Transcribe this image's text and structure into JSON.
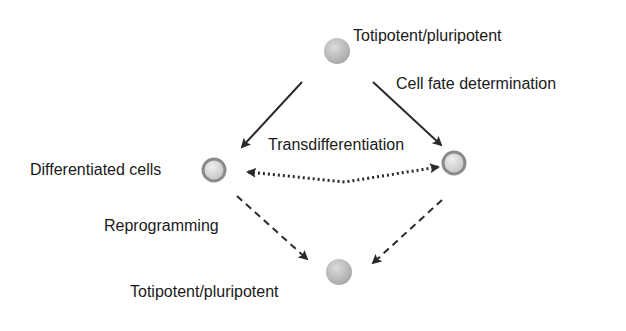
{
  "diagram": {
    "nodes": {
      "top": {
        "label": "Totipotent/pluripotent",
        "type": "totipotent"
      },
      "left": {
        "label": "Differentiated cells",
        "type": "differentiated"
      },
      "right": {
        "label": "",
        "type": "differentiated"
      },
      "bottom": {
        "label": "Totipotent/pluripotent",
        "type": "totipotent"
      }
    },
    "edges": {
      "fate": {
        "label": "Cell fate determination",
        "style": "solid"
      },
      "trans": {
        "label": "Transdifferentiation",
        "style": "dotted",
        "bidirectional": true
      },
      "reprog": {
        "label": "Reprogramming",
        "style": "dashed"
      }
    },
    "colors": {
      "arrow": "#2a2a2a",
      "totipotent_fill": "#c0c0c0",
      "differentiated_ring": "#8a8a8a",
      "differentiated_fill": "#d8d8d8"
    }
  }
}
